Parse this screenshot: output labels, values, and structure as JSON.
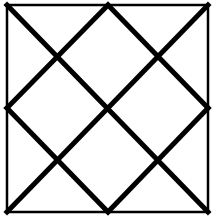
{
  "diagram": {
    "stroke_color": "#000000",
    "background_color": "#ffffff",
    "square": {
      "x1": 7,
      "y1": 5,
      "x2": 208,
      "y2": 212,
      "stroke_width": 2.5
    },
    "lines": [
      {
        "name": "diagonal-top-left-to-bottom-right",
        "x1": 7,
        "y1": 5,
        "x2": 208,
        "y2": 212
      },
      {
        "name": "diagonal-top-right-to-bottom-left",
        "x1": 208,
        "y1": 5,
        "x2": 7,
        "y2": 212
      },
      {
        "name": "diamond-top-to-right",
        "x1": 108,
        "y1": 5,
        "x2": 208,
        "y2": 108
      },
      {
        "name": "diamond-right-to-bottom",
        "x1": 208,
        "y1": 108,
        "x2": 108,
        "y2": 212
      },
      {
        "name": "diamond-bottom-to-left",
        "x1": 108,
        "y1": 212,
        "x2": 7,
        "y2": 108
      },
      {
        "name": "diamond-left-to-top",
        "x1": 7,
        "y1": 108,
        "x2": 108,
        "y2": 5
      }
    ],
    "line_width": 5
  }
}
